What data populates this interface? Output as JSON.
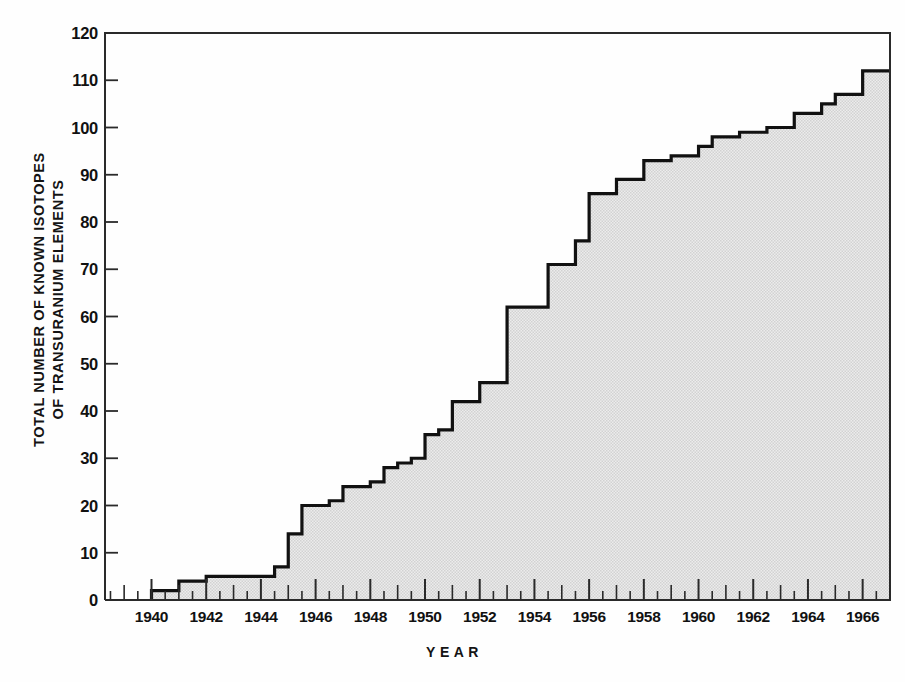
{
  "chart_data": {
    "type": "area",
    "title": "",
    "xlabel": "YEAR",
    "ylabel_line1": "TOTAL NUMBER OF KNOWN ISOTOPES",
    "ylabel_line2": "OF TRANSURANIUM ELEMENTS",
    "xlim": [
      1938.3,
      1967.0
    ],
    "ylim": [
      0,
      120
    ],
    "grid": false,
    "legend": null,
    "y_ticks": [
      0,
      10,
      20,
      30,
      40,
      50,
      60,
      70,
      80,
      90,
      100,
      110,
      120
    ],
    "y_tick_labels": [
      "0",
      "10",
      "20",
      "30",
      "40",
      "50",
      "60",
      "70",
      "80",
      "90",
      "100",
      "110",
      "120"
    ],
    "x_ticks": [
      1940,
      1942,
      1944,
      1946,
      1948,
      1950,
      1952,
      1954,
      1956,
      1958,
      1960,
      1962,
      1964,
      1966
    ],
    "x_tick_labels": [
      "1940",
      "1942",
      "1944",
      "1946",
      "1948",
      "1950",
      "1952",
      "1954",
      "1956",
      "1958",
      "1960",
      "1962",
      "1964",
      "1966"
    ],
    "x_minor_ticks_every": 0.5,
    "step_start_year": 1940.0,
    "step_interval_years": 0.5,
    "x": [
      1940.0,
      1940.5,
      1941.0,
      1941.5,
      1942.0,
      1942.5,
      1943.0,
      1943.5,
      1944.0,
      1944.5,
      1945.0,
      1945.5,
      1946.0,
      1946.5,
      1947.0,
      1947.5,
      1948.0,
      1948.5,
      1949.0,
      1949.5,
      1950.0,
      1950.5,
      1951.0,
      1951.5,
      1952.0,
      1952.5,
      1953.0,
      1953.5,
      1954.0,
      1954.5,
      1955.0,
      1955.5,
      1956.0,
      1956.5,
      1957.0,
      1957.5,
      1958.0,
      1958.5,
      1959.0,
      1959.5,
      1960.0,
      1960.5,
      1961.0,
      1961.5,
      1962.0,
      1962.5,
      1963.0,
      1963.5,
      1964.0,
      1964.5,
      1965.0,
      1965.5,
      1966.0,
      1966.5
    ],
    "values": [
      2,
      2,
      4,
      4,
      5,
      5,
      5,
      5,
      5,
      7,
      14,
      20,
      20,
      21,
      24,
      24,
      25,
      28,
      29,
      30,
      35,
      36,
      42,
      42,
      46,
      46,
      62,
      62,
      62,
      71,
      71,
      76,
      86,
      86,
      89,
      89,
      93,
      93,
      94,
      94,
      96,
      98,
      98,
      99,
      99,
      100,
      100,
      103,
      103,
      105,
      107,
      107,
      112,
      112
    ],
    "fill_color": "#e2e2e2",
    "line_color": "#111111",
    "axis_color": "#2a2a2a",
    "background_color": "#ffffff"
  }
}
